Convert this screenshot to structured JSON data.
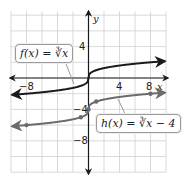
{
  "chart_data": {
    "type": "line",
    "title": "",
    "xlabel": "x",
    "ylabel": "y",
    "xlim": [
      -10,
      10
    ],
    "ylim": [
      -12,
      8
    ],
    "grid": true,
    "grid_step": 2,
    "x_ticks_labeled": [
      "-8",
      "4",
      "8"
    ],
    "y_ticks_labeled": [
      "4",
      "-4",
      "-8"
    ],
    "series": [
      {
        "name": "f(x) = ∛x",
        "color": "#1a1a1a",
        "function": "cbrt(x)",
        "arrows_both_ends": true,
        "points": [
          [
            -8,
            -2
          ],
          [
            -1,
            -1
          ],
          [
            0,
            0
          ],
          [
            1,
            1
          ],
          [
            8,
            2
          ]
        ]
      },
      {
        "name": "h(x) = ∛x − 4",
        "color": "#6b6b6b",
        "function": "cbrt(x) - 4",
        "arrows_both_ends": true,
        "marked_points": [
          [
            -8,
            -6
          ],
          [
            -1,
            -5
          ],
          [
            0,
            -4
          ],
          [
            1,
            -3
          ],
          [
            8,
            -2
          ]
        ]
      }
    ],
    "annotations": [
      {
        "text": "f(x) = ∛x",
        "points_to": "f curve near (-2,-1.3)"
      },
      {
        "text": "h(x) = ∛x − 4",
        "points_to": "h curve near (3,-2.6)"
      }
    ]
  },
  "labels": {
    "axis_x": "x",
    "axis_y": "y",
    "tick_x_neg8": "−8",
    "tick_x_4": "4",
    "tick_x_8": "8",
    "tick_y_4": "4",
    "tick_y_neg4": "−4",
    "tick_y_neg8": "−8",
    "f_label": "f(x) = ∛x",
    "h_label": "h(x) = ∛x − 4"
  }
}
